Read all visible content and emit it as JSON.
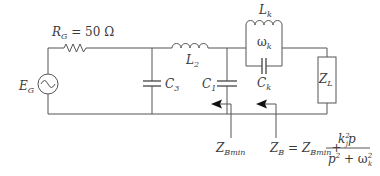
{
  "diagram": {
    "type": "circuit-schematic",
    "components": {
      "source": {
        "symbol": "E",
        "sub": "G"
      },
      "resistor": {
        "symbol": "R",
        "sub": "G",
        "value": " = 50 Ω"
      },
      "capacitor_3": {
        "symbol": "C",
        "sub": "3"
      },
      "inductor_2": {
        "symbol": "L",
        "sub": "2"
      },
      "capacitor_1": {
        "symbol": "C",
        "sub": "1"
      },
      "tank_inductor": {
        "symbol": "L",
        "sub": "k"
      },
      "tank_frequency": {
        "symbol": "ω",
        "sub": "k"
      },
      "tank_capacitor": {
        "symbol": "C",
        "sub": "k"
      },
      "load": {
        "symbol": "Z",
        "sub": "L"
      }
    },
    "annotations": {
      "zbmin": {
        "symbol": "Z",
        "sub": "Bmin"
      },
      "zb_formula": {
        "lhs_symbol": "Z",
        "lhs_sub": "B",
        "equals": " = ",
        "term_symbol": "Z",
        "term_sub": "Bmin",
        "plus": "+",
        "numerator_k": "k",
        "numerator_k_sup": "2",
        "numerator_k_sub": "j",
        "numerator_p": "p",
        "denominator_p": "p",
        "denominator_p_sup": "2",
        "denominator_plus": " + ",
        "denominator_omega": "ω",
        "denominator_omega_sup": "2",
        "denominator_omega_sub": "k"
      }
    },
    "colors": {
      "wire": "#555555",
      "text": "#3a3a3a",
      "arrowhead": "#111111",
      "background": "#ffffff"
    }
  }
}
